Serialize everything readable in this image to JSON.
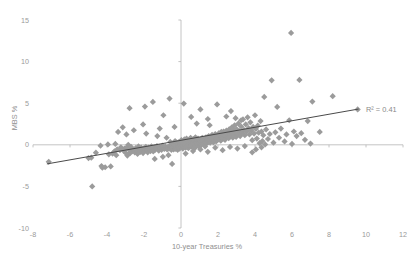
{
  "chart_data": {
    "type": "scatter",
    "title": "",
    "xlabel": "10-year Treasuries %",
    "ylabel": "MBS %",
    "xlim": [
      -8,
      12
    ],
    "ylim": [
      -10,
      15
    ],
    "grid": false,
    "legend": null,
    "xticks": [
      "-8",
      "-6",
      "-4",
      "-2",
      "0",
      "2",
      "4",
      "6",
      "8",
      "10",
      "12"
    ],
    "xtick_values": [
      -8,
      -6,
      -4,
      -2,
      0,
      2,
      4,
      6,
      8,
      10,
      12
    ],
    "yticks": [
      "15",
      "10",
      "5",
      "0",
      "-5",
      "-10"
    ],
    "ytick_values": [
      15,
      10,
      5,
      0,
      -5,
      -10
    ],
    "annotations": [
      {
        "name": "r-squared",
        "text": "R² = 0.41",
        "x": 10.0,
        "y": 4.3
      }
    ],
    "trendline": {
      "x0": -7.25,
      "y0": -2.3,
      "x1": 9.6,
      "y1": 4.3,
      "r_squared": 0.41,
      "color": "#4a4a4a"
    },
    "marker": {
      "shape": "diamond",
      "color": "#9b9b9b",
      "size": 3.1
    },
    "series": [
      {
        "name": "MBS vs 10-year Treasuries",
        "points": [
          [
            -7.15,
            -2.05
          ],
          [
            -5.0,
            -1.6
          ],
          [
            -4.85,
            -1.55
          ],
          [
            -4.8,
            -5.0
          ],
          [
            -4.6,
            -0.95
          ],
          [
            -4.35,
            -0.1
          ],
          [
            -4.3,
            -2.55
          ],
          [
            -4.25,
            -2.75
          ],
          [
            -4.1,
            -2.7
          ],
          [
            -3.95,
            0.05
          ],
          [
            -3.9,
            -1.15
          ],
          [
            -3.8,
            -2.6
          ],
          [
            -3.7,
            -1.05
          ],
          [
            -3.6,
            -0.8
          ],
          [
            -3.55,
            0.1
          ],
          [
            -3.5,
            -1.25
          ],
          [
            -3.45,
            -0.55
          ],
          [
            -3.4,
            1.55
          ],
          [
            -3.3,
            -0.65
          ],
          [
            -3.25,
            -0.3
          ],
          [
            -3.15,
            2.1
          ],
          [
            -3.1,
            -0.7
          ],
          [
            -3.05,
            -0.45
          ],
          [
            -3.0,
            -0.95
          ],
          [
            -2.95,
            -0.35
          ],
          [
            -2.9,
            -1.3
          ],
          [
            -2.85,
            0.0
          ],
          [
            -2.8,
            -0.6
          ],
          [
            -2.75,
            -1.0
          ],
          [
            -2.7,
            -0.25
          ],
          [
            -2.65,
            -0.8
          ],
          [
            -2.6,
            -0.55
          ],
          [
            -2.55,
            1.75
          ],
          [
            -2.5,
            -0.9
          ],
          [
            -2.45,
            -0.4
          ],
          [
            -2.4,
            -0.7
          ],
          [
            -2.35,
            -1.1
          ],
          [
            -2.3,
            -0.2
          ],
          [
            -2.25,
            -0.65
          ],
          [
            -2.2,
            -0.85
          ],
          [
            -2.15,
            -0.35
          ],
          [
            -2.1,
            -0.55
          ],
          [
            -2.05,
            -1.0
          ],
          [
            -2.0,
            -0.45
          ],
          [
            -1.95,
            -0.7
          ],
          [
            -1.9,
            -0.25
          ],
          [
            -1.88,
            1.35
          ],
          [
            -1.85,
            -0.6
          ],
          [
            -1.8,
            -0.9
          ],
          [
            -1.75,
            -0.35
          ],
          [
            -1.7,
            -0.55
          ],
          [
            -1.65,
            -0.75
          ],
          [
            -1.6,
            -0.2
          ],
          [
            -1.55,
            -0.5
          ],
          [
            -1.5,
            -0.8
          ],
          [
            -1.45,
            -0.3
          ],
          [
            -1.42,
            -1.7
          ],
          [
            -1.4,
            -0.6
          ],
          [
            -1.35,
            -0.4
          ],
          [
            -1.3,
            -0.15
          ],
          [
            -1.28,
            1.05
          ],
          [
            -1.25,
            -0.55
          ],
          [
            -1.2,
            -0.7
          ],
          [
            -1.15,
            -0.25
          ],
          [
            -1.1,
            -0.45
          ],
          [
            -1.05,
            -0.6
          ],
          [
            -1.0,
            -0.1
          ],
          [
            -0.98,
            -1.45
          ],
          [
            -0.95,
            -0.35
          ],
          [
            -0.9,
            -0.5
          ],
          [
            -0.85,
            -0.2
          ],
          [
            -0.8,
            -0.4
          ],
          [
            -0.78,
            0.85
          ],
          [
            -0.75,
            -0.55
          ],
          [
            -0.7,
            -0.25
          ],
          [
            -0.68,
            -1.25
          ],
          [
            -0.65,
            -0.45
          ],
          [
            -0.6,
            -0.1
          ],
          [
            -0.58,
            0.35
          ],
          [
            -0.55,
            -0.35
          ],
          [
            -0.52,
            -0.6
          ],
          [
            -0.5,
            -0.2
          ],
          [
            -0.48,
            -2.3
          ],
          [
            -0.45,
            -0.4
          ],
          [
            -0.42,
            0.15
          ],
          [
            -0.4,
            -0.55
          ],
          [
            -0.38,
            -0.25
          ],
          [
            -0.35,
            -0.05
          ],
          [
            -0.32,
            0.45
          ],
          [
            -0.3,
            -0.35
          ],
          [
            -0.28,
            -0.5
          ],
          [
            -0.25,
            -0.15
          ],
          [
            -0.22,
            0.25
          ],
          [
            -0.2,
            -0.4
          ],
          [
            -0.18,
            -0.6
          ],
          [
            -0.15,
            0.05
          ],
          [
            -0.12,
            -0.25
          ],
          [
            -0.1,
            0.35
          ],
          [
            -0.08,
            -0.45
          ],
          [
            -0.05,
            -0.1
          ],
          [
            -0.02,
            0.2
          ],
          [
            0.0,
            -0.3
          ],
          [
            0.02,
            0.55
          ],
          [
            0.05,
            -0.15
          ],
          [
            0.08,
            0.3
          ],
          [
            0.1,
            -0.45
          ],
          [
            0.12,
            0.1
          ],
          [
            0.15,
            -0.25
          ],
          [
            0.18,
            0.65
          ],
          [
            0.2,
            -0.05
          ],
          [
            0.22,
            0.4
          ],
          [
            0.25,
            -0.35
          ],
          [
            0.28,
            0.2
          ],
          [
            0.3,
            0.75
          ],
          [
            0.32,
            -0.15
          ],
          [
            0.35,
            0.45
          ],
          [
            0.38,
            0.05
          ],
          [
            0.4,
            -0.4
          ],
          [
            0.42,
            0.3
          ],
          [
            0.45,
            0.6
          ],
          [
            0.48,
            0.15
          ],
          [
            0.5,
            -0.2
          ],
          [
            0.52,
            0.85
          ],
          [
            0.55,
            0.35
          ],
          [
            0.58,
            0.0
          ],
          [
            0.6,
            0.5
          ],
          [
            0.62,
            -0.3
          ],
          [
            0.65,
            0.25
          ],
          [
            0.68,
            0.7
          ],
          [
            0.7,
            0.1
          ],
          [
            0.72,
            -0.45
          ],
          [
            0.75,
            0.4
          ],
          [
            0.78,
            0.9
          ],
          [
            0.8,
            0.2
          ],
          [
            0.82,
            -0.15
          ],
          [
            0.85,
            0.55
          ],
          [
            0.88,
            0.3
          ],
          [
            0.9,
            0.05
          ],
          [
            0.92,
            0.75
          ],
          [
            0.95,
            0.45
          ],
          [
            0.98,
            -0.25
          ],
          [
            1.0,
            0.2
          ],
          [
            1.05,
            0.6
          ],
          [
            1.08,
            0.35
          ],
          [
            1.1,
            0.0
          ],
          [
            1.15,
            0.85
          ],
          [
            1.18,
            0.45
          ],
          [
            1.2,
            0.15
          ],
          [
            1.25,
            0.65
          ],
          [
            1.28,
            0.3
          ],
          [
            1.3,
            -0.2
          ],
          [
            1.35,
            0.9
          ],
          [
            1.38,
            0.5
          ],
          [
            1.4,
            0.2
          ],
          [
            1.45,
            0.7
          ],
          [
            1.48,
            0.35
          ],
          [
            1.5,
            1.05
          ],
          [
            1.55,
            0.55
          ],
          [
            1.58,
            0.25
          ],
          [
            1.6,
            0.85
          ],
          [
            1.65,
            0.45
          ],
          [
            1.68,
            1.2
          ],
          [
            1.7,
            0.65
          ],
          [
            1.75,
            0.3
          ],
          [
            1.78,
            0.95
          ],
          [
            1.8,
            0.55
          ],
          [
            1.85,
            1.3
          ],
          [
            1.88,
            0.75
          ],
          [
            1.9,
            0.4
          ],
          [
            1.95,
            1.1
          ],
          [
            1.98,
            0.6
          ],
          [
            2.0,
            0.9
          ],
          [
            2.05,
            1.4
          ],
          [
            2.08,
            0.7
          ],
          [
            2.1,
            1.15
          ],
          [
            2.15,
            0.5
          ],
          [
            2.18,
            1.55
          ],
          [
            2.2,
            0.95
          ],
          [
            2.25,
            1.25
          ],
          [
            2.28,
            0.75
          ],
          [
            2.3,
            1.6
          ],
          [
            2.35,
            1.05
          ],
          [
            2.38,
            0.6
          ],
          [
            2.4,
            1.35
          ],
          [
            2.45,
            1.7
          ],
          [
            2.48,
            0.95
          ],
          [
            2.5,
            1.2
          ],
          [
            2.55,
            1.5
          ],
          [
            2.58,
            0.8
          ],
          [
            2.6,
            1.85
          ],
          [
            2.65,
            1.3
          ],
          [
            2.68,
            1.0
          ],
          [
            2.7,
            1.6
          ],
          [
            2.75,
            2.1
          ],
          [
            2.78,
            1.4
          ],
          [
            2.8,
            0.85
          ],
          [
            2.85,
            1.75
          ],
          [
            2.88,
            1.2
          ],
          [
            2.9,
            2.35
          ],
          [
            2.95,
            1.55
          ],
          [
            2.98,
            0.95
          ],
          [
            3.0,
            1.9
          ],
          [
            3.05,
            1.3
          ],
          [
            3.1,
            2.55
          ],
          [
            3.15,
            1.65
          ],
          [
            3.2,
            1.05
          ],
          [
            3.25,
            2.2
          ],
          [
            3.3,
            1.45
          ],
          [
            3.35,
            3.05
          ],
          [
            3.4,
            1.8
          ],
          [
            3.45,
            1.15
          ],
          [
            3.5,
            2.45
          ],
          [
            3.55,
            1.6
          ],
          [
            3.6,
            3.3
          ],
          [
            3.65,
            2.0
          ],
          [
            3.7,
            1.25
          ],
          [
            3.75,
            2.7
          ],
          [
            3.8,
            1.7
          ],
          [
            3.85,
            0.55
          ],
          [
            3.9,
            2.15
          ],
          [
            3.95,
            1.35
          ],
          [
            4.0,
            3.55
          ],
          [
            4.05,
            1.9
          ],
          [
            4.1,
            0.75
          ],
          [
            4.15,
            2.3
          ],
          [
            4.2,
            1.45
          ],
          [
            4.25,
            0.2
          ],
          [
            4.3,
            2.85
          ],
          [
            4.35,
            1.6
          ],
          [
            4.4,
            0.45
          ],
          [
            4.45,
            1.15
          ],
          [
            4.5,
            5.75
          ],
          [
            4.55,
            0.05
          ],
          [
            4.6,
            1.85
          ],
          [
            4.7,
            0.7
          ],
          [
            4.8,
            1.3
          ],
          [
            4.9,
            7.75
          ],
          [
            5.0,
            0.25
          ],
          [
            5.1,
            1.5
          ],
          [
            5.2,
            4.55
          ],
          [
            5.3,
            0.85
          ],
          [
            5.4,
            1.95
          ],
          [
            5.6,
            0.4
          ],
          [
            5.7,
            1.25
          ],
          [
            5.85,
            2.95
          ],
          [
            5.95,
            13.45
          ],
          [
            6.0,
            0.1
          ],
          [
            6.1,
            1.6
          ],
          [
            6.25,
            1.05
          ],
          [
            6.4,
            7.8
          ],
          [
            6.5,
            1.4
          ],
          [
            6.7,
            0.6
          ],
          [
            6.85,
            2.85
          ],
          [
            7.0,
            0.15
          ],
          [
            7.1,
            5.2
          ],
          [
            7.5,
            1.55
          ],
          [
            8.2,
            5.85
          ],
          [
            9.55,
            4.25
          ],
          [
            -2.78,
            4.4
          ],
          [
            -1.95,
            4.6
          ],
          [
            -1.52,
            5.15
          ],
          [
            -0.95,
            3.55
          ],
          [
            -0.62,
            5.55
          ],
          [
            0.15,
            4.95
          ],
          [
            0.55,
            3.35
          ],
          [
            1.05,
            4.25
          ],
          [
            1.45,
            3.1
          ],
          [
            1.95,
            4.85
          ],
          [
            2.45,
            3.4
          ],
          [
            2.7,
            4.05
          ],
          [
            2.95,
            3.2
          ],
          [
            3.25,
            2.95
          ],
          [
            0.85,
            2.55
          ],
          [
            1.55,
            2.35
          ],
          [
            -0.35,
            2.15
          ],
          [
            -1.15,
            1.95
          ],
          [
            -2.05,
            2.45
          ],
          [
            -2.95,
            1.25
          ],
          [
            0.25,
            -1.05
          ],
          [
            0.65,
            -0.75
          ],
          [
            1.05,
            -0.55
          ],
          [
            1.45,
            -0.85
          ],
          [
            1.85,
            -0.35
          ],
          [
            2.25,
            -0.65
          ],
          [
            2.65,
            -0.25
          ],
          [
            3.05,
            -0.45
          ],
          [
            3.45,
            -0.15
          ],
          [
            3.85,
            -0.9
          ],
          [
            4.05,
            -0.55
          ],
          [
            4.35,
            -0.3
          ]
        ]
      }
    ]
  },
  "axes": {
    "x_axis_name": "x-axis",
    "y_axis_name": "y-axis"
  }
}
